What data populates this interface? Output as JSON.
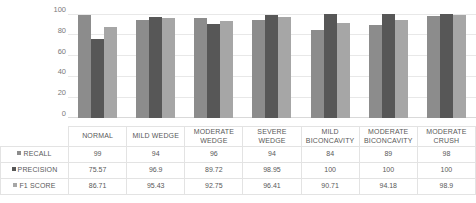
{
  "chart_data": {
    "type": "bar",
    "title": "",
    "xlabel": "",
    "ylabel": "",
    "ylim": [
      0,
      100
    ],
    "yticks": [
      0,
      20,
      40,
      60,
      80,
      100
    ],
    "grid": true,
    "legend_position": "table-left",
    "categories": [
      "NORMAL",
      "MILD WEDGE",
      "MODERATE WEDGE",
      "SEVERE WEDGE",
      "MILD BICONCAVITY",
      "MODERATE BICONCAVITY",
      "MODERATE CRUSH"
    ],
    "series": [
      {
        "name": "RECALL",
        "color": "#8c8c8c",
        "values": [
          99,
          94,
          96,
          94,
          84,
          89,
          98
        ],
        "labels": [
          "99",
          "94",
          "96",
          "94",
          "84",
          "89",
          "98"
        ]
      },
      {
        "name": "PRECISION",
        "color": "#575757",
        "values": [
          75.57,
          96.9,
          89.72,
          98.95,
          100,
          100,
          100
        ],
        "labels": [
          "75.57",
          "96.9",
          "89.72",
          "98.95",
          "100",
          "100",
          "100"
        ]
      },
      {
        "name": "F1 SCORE",
        "color": "#a6a6a6",
        "values": [
          86.71,
          95.43,
          92.75,
          96.41,
          90.71,
          94.18,
          98.9
        ],
        "labels": [
          "86.71",
          "95.43",
          "92.75",
          "96.41",
          "90.71",
          "94.18",
          "98.9"
        ]
      }
    ]
  },
  "axis": {
    "tick_100": "100",
    "tick_80": "80",
    "tick_60": "60",
    "tick_40": "40",
    "tick_20": "20",
    "tick_0": "0"
  },
  "table": {
    "headers": [
      "NORMAL",
      "MILD WEDGE",
      "MODERATE WEDGE",
      "SEVERE WEDGE",
      "MILD BICONCAVITY",
      "MODERATE BICONCAVITY",
      "MODERATE CRUSH"
    ],
    "rows": [
      {
        "label": "RECALL",
        "values": [
          "99",
          "94",
          "96",
          "94",
          "84",
          "89",
          "98"
        ]
      },
      {
        "label": "PRECISION",
        "values": [
          "75.57",
          "96.9",
          "89.72",
          "98.95",
          "100",
          "100",
          "100"
        ]
      },
      {
        "label": "F1 SCORE",
        "values": [
          "86.71",
          "95.43",
          "92.75",
          "96.41",
          "90.71",
          "94.18",
          "98.9"
        ]
      }
    ]
  },
  "colors": {
    "recall": "#8c8c8c",
    "precision": "#575757",
    "f1": "#a6a6a6",
    "grid": "#e8e8e8",
    "text": "#595959"
  }
}
